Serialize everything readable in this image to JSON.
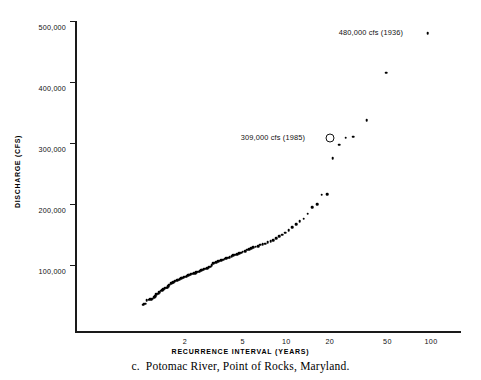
{
  "caption": {
    "letter": "c.",
    "text": "Potomac River, Point of Rocks, Maryland."
  },
  "chart_data": {
    "type": "scatter",
    "title": "",
    "xlabel": "RECURRENCE INTERVAL (YEARS)",
    "ylabel": "DISCHARGE (CFS)",
    "xscale": "log",
    "yscale": "linear",
    "grid": false,
    "legend": null,
    "xlim": [
      1.01,
      150
    ],
    "ylim": [
      0,
      500000
    ],
    "xticks": [
      2,
      5,
      10,
      20,
      50,
      100
    ],
    "xtick_labels": [
      "2",
      "5",
      "10",
      "20",
      "50",
      "100"
    ],
    "yticks": [
      100000,
      200000,
      300000,
      400000,
      500000
    ],
    "ytick_labels": [
      "100,000",
      "200,000",
      "300,000",
      "400,000",
      "500,000"
    ],
    "annotations": [
      {
        "id": "annotation-1936",
        "text": "480,000 cfs (1936)",
        "value": 480000,
        "year": 1936,
        "x": 95,
        "y": 480000
      },
      {
        "id": "annotation-1985",
        "text": "309,000 cfs (1985)",
        "value": 309000,
        "year": 1985,
        "x": 20,
        "y": 309000,
        "marker": "circled"
      }
    ],
    "points": [
      [
        1.02,
        35000
      ],
      [
        1.04,
        36000
      ],
      [
        1.06,
        36500
      ],
      [
        1.09,
        42000
      ],
      [
        1.12,
        43000
      ],
      [
        1.15,
        43500
      ],
      [
        1.18,
        44000
      ],
      [
        1.2,
        45000
      ],
      [
        1.22,
        47000
      ],
      [
        1.25,
        49000
      ],
      [
        1.27,
        52000
      ],
      [
        1.3,
        53000
      ],
      [
        1.33,
        55000
      ],
      [
        1.36,
        58000
      ],
      [
        1.39,
        59000
      ],
      [
        1.42,
        60000
      ],
      [
        1.45,
        62000
      ],
      [
        1.48,
        62500
      ],
      [
        1.5,
        63000
      ],
      [
        1.53,
        65000
      ],
      [
        1.56,
        68000
      ],
      [
        1.6,
        70000
      ],
      [
        1.63,
        71000
      ],
      [
        1.66,
        72000
      ],
      [
        1.7,
        73000
      ],
      [
        1.73,
        74000
      ],
      [
        1.77,
        75000
      ],
      [
        1.8,
        76000
      ],
      [
        1.84,
        77000
      ],
      [
        1.88,
        78000
      ],
      [
        1.92,
        79000
      ],
      [
        1.96,
        80000
      ],
      [
        2.0,
        81000
      ],
      [
        2.05,
        82000
      ],
      [
        2.1,
        83000
      ],
      [
        2.14,
        84000
      ],
      [
        2.19,
        85000
      ],
      [
        2.24,
        86000
      ],
      [
        2.3,
        86500
      ],
      [
        2.35,
        87000
      ],
      [
        2.4,
        88000
      ],
      [
        2.46,
        89000
      ],
      [
        2.52,
        90000
      ],
      [
        2.58,
        91000
      ],
      [
        2.64,
        92000
      ],
      [
        2.7,
        93000
      ],
      [
        2.77,
        94000
      ],
      [
        2.84,
        95000
      ],
      [
        2.91,
        96000
      ],
      [
        2.98,
        97000
      ],
      [
        3.05,
        100000
      ],
      [
        3.13,
        103000
      ],
      [
        3.21,
        104000
      ],
      [
        3.3,
        105000
      ],
      [
        3.38,
        106000
      ],
      [
        3.47,
        107000
      ],
      [
        3.56,
        108000
      ],
      [
        3.66,
        109000
      ],
      [
        3.76,
        110000
      ],
      [
        3.86,
        111000
      ],
      [
        3.97,
        112000
      ],
      [
        4.08,
        113000
      ],
      [
        4.2,
        114000
      ],
      [
        4.32,
        116000
      ],
      [
        4.45,
        117000
      ],
      [
        4.58,
        118000
      ],
      [
        4.72,
        119000
      ],
      [
        4.87,
        120000
      ],
      [
        5.02,
        122000
      ],
      [
        5.19,
        123000
      ],
      [
        5.36,
        125000
      ],
      [
        5.54,
        126000
      ],
      [
        5.73,
        128000
      ],
      [
        5.94,
        129000
      ],
      [
        6.15,
        130000
      ],
      [
        6.38,
        131000
      ],
      [
        6.63,
        133000
      ],
      [
        6.89,
        134000
      ],
      [
        7.17,
        135000
      ],
      [
        7.47,
        137000
      ],
      [
        7.79,
        139000
      ],
      [
        8.14,
        141000
      ],
      [
        8.52,
        144000
      ],
      [
        8.93,
        147000
      ],
      [
        9.38,
        150000
      ],
      [
        9.87,
        153000
      ],
      [
        10.4,
        157000
      ],
      [
        11.0,
        162000
      ],
      [
        11.7,
        167000
      ],
      [
        12.4,
        172000
      ],
      [
        13.2,
        176000
      ],
      [
        14.1,
        184000
      ],
      [
        15.1,
        195000
      ],
      [
        16.3,
        200000
      ],
      [
        17.6,
        215000
      ],
      [
        19.2,
        216000
      ],
      [
        21.0,
        275000
      ],
      [
        23.2,
        297000
      ],
      [
        25.8,
        309000
      ],
      [
        29.0,
        310000
      ],
      [
        36.0,
        337000
      ],
      [
        49.0,
        415000
      ],
      [
        95.0,
        480000
      ]
    ]
  }
}
